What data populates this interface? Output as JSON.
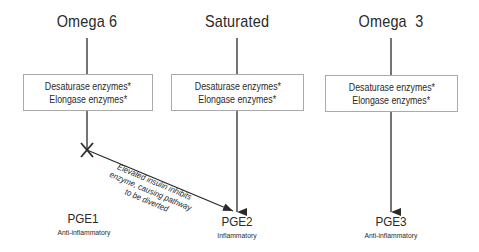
{
  "columns": [
    {
      "title": "Omega 6",
      "enzymes": [
        "Desaturase enzymes*",
        "Elongase enzymes*"
      ],
      "product": "PGE1",
      "effect": "Anti-inflammatory"
    },
    {
      "title": "Saturated",
      "enzymes": [
        "Desaturase enzymes*",
        "Elongase enzymes*"
      ],
      "product": "PGE2",
      "effect": "Inflammatory"
    },
    {
      "title": "Omega  3",
      "enzymes": [
        "Desaturase enzymes*",
        "Elongase enzymes*"
      ],
      "product": "PGE3",
      "effect": "Anti-inflammatory"
    }
  ],
  "diversion_note": [
    "Elevated insulin inhibits",
    "enzyme, causing pathway",
    "to be diverted"
  ],
  "colors": {
    "line": "#2a2a2a",
    "box_border": "#aaaaaa",
    "text": "#2a2a2a"
  }
}
